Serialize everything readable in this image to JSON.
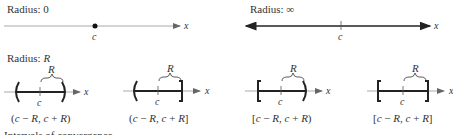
{
  "panels": {
    "radius_zero": {
      "title": "Radius: 0",
      "center_label": "c",
      "axis_label": "x"
    },
    "radius_infinity": {
      "title": "Radius: ∞",
      "center_label": "c",
      "axis_label": "x"
    },
    "radius_r": {
      "title_prefix": "Radius: ",
      "title_var": "R",
      "intervals": [
        {
          "notation": "(c − R,  c + R)",
          "left": "(",
          "right": ")",
          "radius_label": "R",
          "center_label": "c",
          "axis_label": "x"
        },
        {
          "notation": "(c − R,  c + R]",
          "left": "(",
          "right": "]",
          "radius_label": "R",
          "center_label": "c",
          "axis_label": "x"
        },
        {
          "notation": "[c − R,  c + R)",
          "left": "[",
          "right": ")",
          "radius_label": "R",
          "center_label": "c",
          "axis_label": "x"
        },
        {
          "notation": "[c − R,  c + R]",
          "left": "[",
          "right": "]",
          "radius_label": "R",
          "center_label": "c",
          "axis_label": "x"
        }
      ]
    }
  },
  "footer_partial": "Intervals of convergence"
}
